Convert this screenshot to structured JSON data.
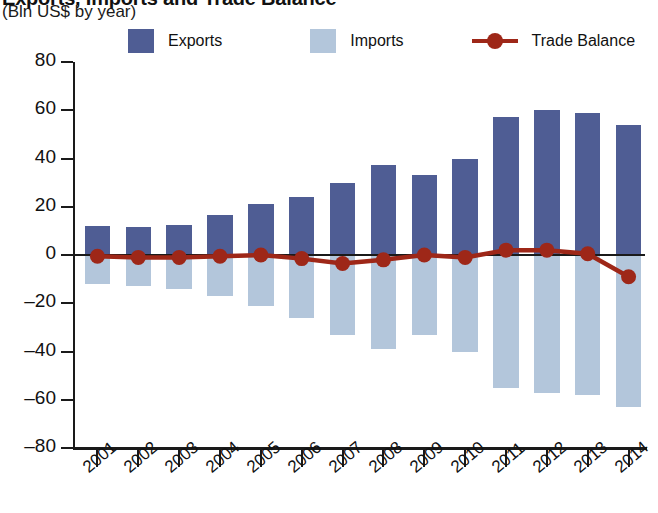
{
  "title": {
    "main": "Exports, Imports and Trade Balance",
    "sub": "(Bln US$ by year)"
  },
  "legend": {
    "items": [
      {
        "label": "Exports",
        "color": "#4f5d94",
        "marker": "square-swatch"
      },
      {
        "label": "Imports",
        "color": "#b3c6db",
        "marker": "square-swatch"
      },
      {
        "label": "Trade Balance",
        "color": "#9e2718",
        "marker": "line-with-dot"
      }
    ]
  },
  "colors": {
    "exports": "#4f5d94",
    "imports": "#b3c6db",
    "trade_balance": "#9e2718",
    "axis": "#1a1a1a",
    "background": "#ffffff"
  },
  "chart_data": {
    "type": "bar",
    "title": "Exports, Imports and Trade Balance",
    "subtitle": "(Bln US$ by year)",
    "xlabel": "",
    "ylabel": "(Bln US$ by year)",
    "ylim": [
      -80,
      80
    ],
    "yticks": [
      80,
      60,
      40,
      20,
      0,
      -20,
      -40,
      -60,
      -80
    ],
    "ytick_labels": [
      "80",
      "60",
      "40",
      "20",
      "0",
      "–20",
      "–40",
      "–60",
      "–80"
    ],
    "grid": false,
    "legend_position": "top",
    "categories": [
      "2001",
      "2002",
      "2003",
      "2004",
      "2005",
      "2006",
      "2007",
      "2008",
      "2009",
      "2010",
      "2011",
      "2012",
      "2013",
      "2014"
    ],
    "series": [
      {
        "name": "Exports",
        "type": "bar",
        "color": "#4f5d94",
        "values": [
          12,
          11.5,
          12.5,
          16.5,
          21,
          24,
          30,
          37.5,
          33,
          40,
          57,
          60,
          59,
          54
        ]
      },
      {
        "name": "Imports",
        "type": "bar",
        "color": "#b3c6db",
        "values": [
          -12,
          -13,
          -14,
          -17,
          -21,
          -26,
          -33,
          -39,
          -33,
          -40,
          -55,
          -57,
          -58,
          -63
        ]
      },
      {
        "name": "Trade Balance",
        "type": "line",
        "color": "#9e2718",
        "values": [
          -0.5,
          -1,
          -1,
          -0.5,
          0,
          -1.5,
          -3.5,
          -2,
          0,
          -1,
          2,
          2,
          0.5,
          -9
        ]
      }
    ]
  }
}
